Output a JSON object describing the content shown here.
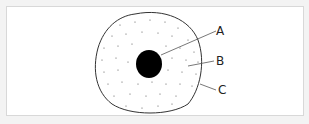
{
  "diagram": {
    "title": "",
    "labels": [
      {
        "id": "A",
        "text": "A",
        "target": "nucleus"
      },
      {
        "id": "B",
        "text": "B",
        "target": "cytoplasm"
      },
      {
        "id": "C",
        "text": "C",
        "target": "cell-membrane"
      }
    ]
  }
}
